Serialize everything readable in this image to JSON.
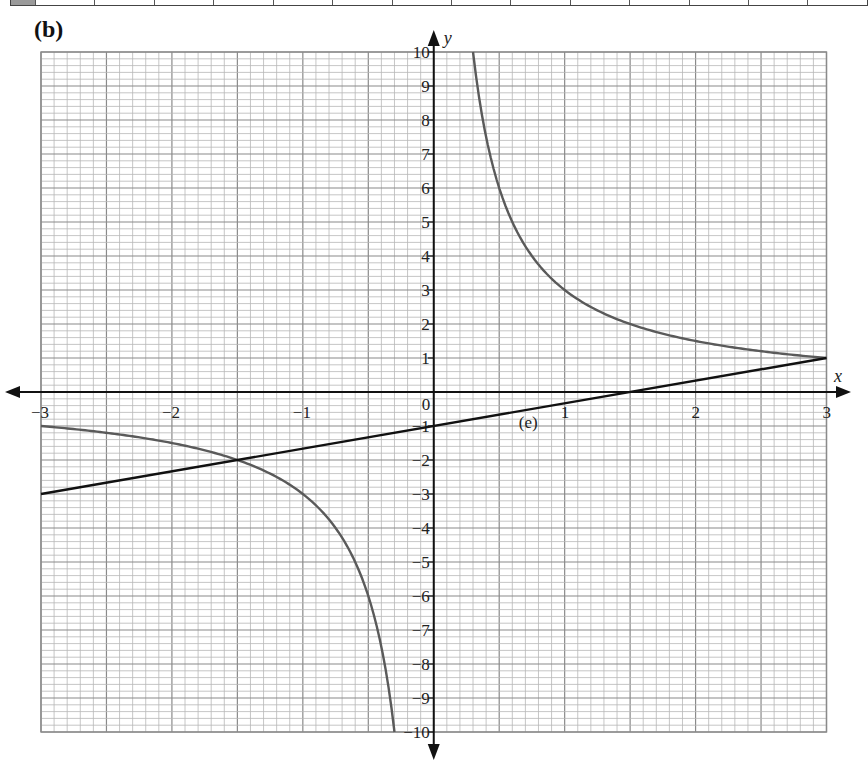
{
  "question": {
    "part_label": "(b)",
    "annotation": "(e)"
  },
  "top_table": {
    "visible_row_label": "y",
    "columns": 14
  },
  "chart_data": {
    "type": "line",
    "title": "",
    "xlabel": "x",
    "ylabel": "y",
    "xlim": [
      -3,
      3
    ],
    "ylim": [
      -10,
      10
    ],
    "grid": true,
    "grid_minor_x_step": 0.1,
    "grid_minor_y_step": 0.2,
    "x_ticks": [
      "−3",
      "−2",
      "−1",
      "0",
      "1",
      "2",
      "3"
    ],
    "y_ticks": [
      "10",
      "9",
      "8",
      "7",
      "6",
      "5",
      "4",
      "3",
      "2",
      "1",
      "−1",
      "−2",
      "−3",
      "−4",
      "−5",
      "−6",
      "−7",
      "−8",
      "−9",
      "−10"
    ],
    "series": [
      {
        "name": "y = 3/x",
        "color": "#555555",
        "branch_negative": {
          "x": [
            -3,
            -2.5,
            -2,
            -1.5,
            -1,
            -0.75,
            -0.5,
            -0.4,
            -0.3
          ],
          "y": [
            -1,
            -1.2,
            -1.5,
            -2,
            -3,
            -4,
            -6,
            -7.5,
            -10
          ]
        },
        "branch_positive": {
          "x": [
            0.3,
            0.4,
            0.5,
            0.75,
            1,
            1.5,
            2,
            2.5,
            3
          ],
          "y": [
            10,
            7.5,
            6,
            4,
            3,
            2,
            1.5,
            1.2,
            1
          ]
        }
      },
      {
        "name": "y = (2/3)x − 1",
        "color": "#111111",
        "x": [
          -3,
          3
        ],
        "y": [
          -3,
          1
        ]
      }
    ],
    "annotations": [
      {
        "text": "(e)",
        "x": 0.65,
        "y": -0.35
      }
    ]
  },
  "colors": {
    "grid_minor": "#b8b8b8",
    "grid_major": "#8a8a8a",
    "axis": "#111111",
    "curve": "#5a5a5a",
    "line": "#111111"
  }
}
